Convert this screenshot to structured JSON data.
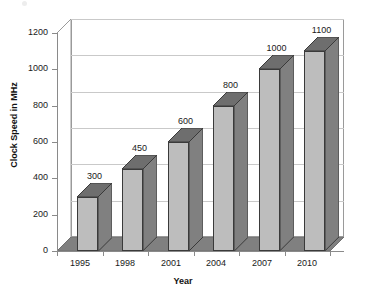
{
  "chart_data": {
    "type": "bar",
    "title": "",
    "xlabel": "Year",
    "ylabel": "Clock Speed in MHz",
    "categories": [
      "1995",
      "1998",
      "2001",
      "2004",
      "2007",
      "2010"
    ],
    "values": [
      300,
      450,
      600,
      800,
      1000,
      1100
    ],
    "data_labels": [
      "300",
      "450",
      "600",
      "800",
      "1000",
      "1100"
    ],
    "ylim": [
      0,
      1200
    ],
    "ytick_values": [
      0,
      200,
      400,
      600,
      800,
      1000,
      1200
    ],
    "ytick_labels": [
      "0",
      "200",
      "400",
      "600",
      "800",
      "1000",
      "1200"
    ],
    "grid": "horizontal",
    "legend": "none",
    "style": "3d-column",
    "colors": {
      "bar_front": "#bdbdbd",
      "bar_side": "#808080",
      "bar_top": "#6e6e6e",
      "bar_outline": "#3a3a3a",
      "floor": "#808080",
      "wall_back": "#ffffff",
      "gridline": "#c9c9c9",
      "axis": "#8a8a8a",
      "text": "#1a1a1a"
    }
  }
}
